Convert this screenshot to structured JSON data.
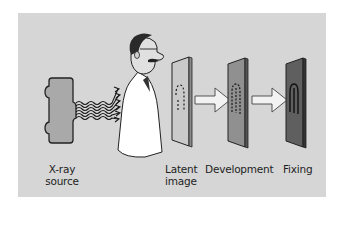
{
  "diagram": {
    "background_color": "#d6d6d6",
    "stages": [
      {
        "id": "source",
        "label_line1": "X-ray",
        "label_line2": "source"
      },
      {
        "id": "latent",
        "label_line1": "Latent",
        "label_line2": "image",
        "plate_color": "#c9c9c9"
      },
      {
        "id": "development",
        "label_line1": "Development",
        "label_line2": "",
        "plate_color": "#8e8e8e"
      },
      {
        "id": "fixing",
        "label_line1": "Fixing",
        "label_line2": "",
        "plate_color": "#5e5e5e"
      }
    ],
    "elements": {
      "subject": "person-in-lab-coat",
      "rays": "wavy-x-ray-arrows",
      "arrows": [
        "latent-to-development",
        "development-to-fixing"
      ]
    }
  }
}
